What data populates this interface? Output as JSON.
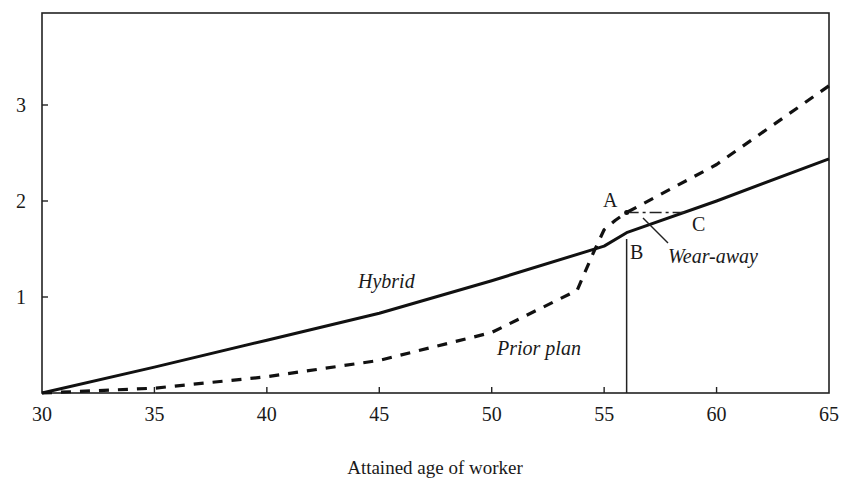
{
  "chart_data": {
    "type": "line",
    "title": "",
    "xlabel": "Attained age of worker",
    "ylabel": "",
    "xlim": [
      30,
      65
    ],
    "ylim": [
      0,
      3.8
    ],
    "xticks": [
      30,
      35,
      40,
      45,
      50,
      55,
      60,
      65
    ],
    "yticks": [
      1,
      2,
      3
    ],
    "grid": false,
    "legend": "none (inline labels)",
    "series": [
      {
        "name": "Hybrid",
        "style": "solid",
        "x": [
          30,
          35,
          40,
          45,
          50,
          55,
          56,
          60,
          65
        ],
        "values": [
          0.0,
          0.27,
          0.55,
          0.83,
          1.17,
          1.53,
          1.67,
          2.0,
          2.44
        ]
      },
      {
        "name": "Prior plan",
        "style": "dashed",
        "x": [
          30,
          35,
          40,
          45,
          50,
          53.8,
          54.5,
          55,
          55.5,
          56,
          60,
          65
        ],
        "values": [
          0.0,
          0.05,
          0.17,
          0.34,
          0.63,
          1.07,
          1.45,
          1.7,
          1.8,
          1.88,
          2.38,
          3.2
        ]
      }
    ],
    "annotations": [
      {
        "text": "A",
        "x": 56,
        "y": 1.88,
        "note": "prior plan value at age 56"
      },
      {
        "text": "B",
        "x": 56,
        "y": 1.67,
        "note": "hybrid value at age 56"
      },
      {
        "text": "C",
        "x": 58.7,
        "y": 1.88,
        "note": "age at which hybrid catches up to A"
      },
      {
        "text": "Wear-away",
        "note": "period between A and C (dash-dot segment)"
      },
      {
        "text": "Hybrid",
        "note": "label for solid line"
      },
      {
        "text": "Prior plan",
        "note": "label for dashed line"
      }
    ],
    "reference_lines": [
      {
        "type": "vertical",
        "x": 56,
        "y_from": 0,
        "y_to": 2.5
      },
      {
        "type": "horizontal-dashdot",
        "y": 1.88,
        "x_from": 56,
        "x_to": 58.7
      }
    ]
  },
  "labels": {
    "hybrid": "Hybrid",
    "prior_plan": "Prior plan",
    "wear_away": "Wear-away",
    "point_a": "A",
    "point_b": "B",
    "point_c": "C",
    "x_axis_title": "Attained age of worker"
  }
}
